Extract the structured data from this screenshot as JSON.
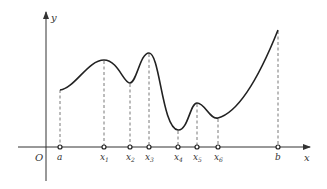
{
  "diagram": {
    "type": "function-graph",
    "axes": {
      "x_label": "x",
      "y_label": "y",
      "origin_label": "O"
    },
    "points": [
      {
        "name": "a",
        "label": "a",
        "sub": "",
        "x": 60,
        "y": 90
      },
      {
        "name": "x1",
        "label": "x",
        "sub": "1",
        "x": 104,
        "y": 60
      },
      {
        "name": "x2",
        "label": "x",
        "sub": "2",
        "x": 130,
        "y": 83
      },
      {
        "name": "x3",
        "label": "x",
        "sub": "3",
        "x": 149,
        "y": 53
      },
      {
        "name": "x4",
        "label": "x",
        "sub": "4",
        "x": 178,
        "y": 130
      },
      {
        "name": "x5",
        "label": "x",
        "sub": "5",
        "x": 197,
        "y": 103
      },
      {
        "name": "x6",
        "label": "x",
        "sub": "6",
        "x": 218,
        "y": 118
      },
      {
        "name": "b",
        "label": "b",
        "sub": "",
        "x": 278,
        "y": 30
      }
    ],
    "colors": {
      "stroke": "#222222",
      "axis": "#333333",
      "dash": "#555555"
    }
  }
}
